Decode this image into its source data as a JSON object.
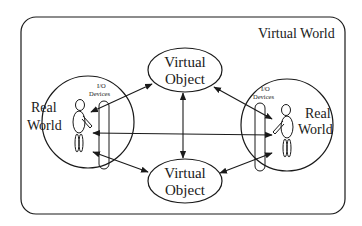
{
  "diagram": {
    "container": {
      "label": "Virtual World"
    },
    "nodes": {
      "virtual_object_top": {
        "line1": "Virtual",
        "line2": "Object"
      },
      "virtual_object_bottom": {
        "line1": "Virtual",
        "line2": "Object"
      },
      "real_world_left": {
        "line1": "Real",
        "line2": "World",
        "io_line1": "I/O",
        "io_line2": "Devices"
      },
      "real_world_right": {
        "line1": "Real",
        "line2": "World",
        "io_line1": "I/O",
        "io_line2": "Devices"
      }
    },
    "edges": [
      {
        "from": "real_world_left",
        "to": "virtual_object_top",
        "direction": "bidirectional"
      },
      {
        "from": "real_world_left",
        "to": "virtual_object_bottom",
        "direction": "bidirectional"
      },
      {
        "from": "real_world_right",
        "to": "virtual_object_top",
        "direction": "bidirectional"
      },
      {
        "from": "real_world_right",
        "to": "virtual_object_bottom",
        "direction": "bidirectional"
      },
      {
        "from": "virtual_object_top",
        "to": "virtual_object_bottom",
        "direction": "bidirectional"
      },
      {
        "from": "real_world_left",
        "to": "real_world_right",
        "direction": "bidirectional"
      }
    ],
    "colors": {
      "ink": "#1a1a1a",
      "background": "#ffffff"
    }
  }
}
